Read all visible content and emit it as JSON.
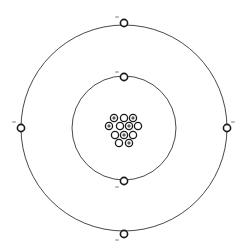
{
  "diagram": {
    "type": "bohr-atom-model",
    "center": [
      124,
      128
    ],
    "colors": {
      "line": "#333333",
      "particle": "#1a1a1a",
      "background": "#ffffff",
      "charge_sign": "#555555"
    },
    "shells": [
      {
        "name": "inner-shell",
        "radius": 52,
        "electrons": [
          {
            "angle": "top",
            "x": 124,
            "y": 77,
            "sign": "-",
            "sign_pos": [
              117,
              72
            ]
          },
          {
            "angle": "bottom",
            "x": 124,
            "y": 181,
            "sign": "-",
            "sign_pos": [
              117,
              187
            ]
          }
        ]
      },
      {
        "name": "outer-shell",
        "radius": 103,
        "electrons": [
          {
            "angle": "top",
            "x": 124,
            "y": 23,
            "sign": "-",
            "sign_pos": [
              117,
              17
            ]
          },
          {
            "angle": "bottom",
            "x": 124,
            "y": 234,
            "sign": "-",
            "sign_pos": [
              117,
              240
            ]
          },
          {
            "angle": "left",
            "x": 21,
            "y": 128,
            "sign": "-",
            "sign_pos": [
              14,
              122
            ]
          },
          {
            "angle": "right",
            "x": 227,
            "y": 128,
            "sign": "-",
            "sign_pos": [
              233,
              122
            ]
          }
        ]
      }
    ],
    "nucleus": {
      "particle_radius": 3.6,
      "protons": [
        [
          114,
          118
        ],
        [
          133,
          118
        ],
        [
          109,
          126
        ],
        [
          129,
          126
        ],
        [
          124,
          135
        ],
        [
          129,
          143
        ]
      ],
      "neutrons": [
        [
          124,
          118
        ],
        [
          120,
          126
        ],
        [
          138,
          126
        ],
        [
          115,
          135
        ],
        [
          133,
          135
        ],
        [
          119,
          143
        ]
      ],
      "proton_count": 6,
      "neutron_count": 6
    },
    "electron_radius": 3.6,
    "electron_count": 6
  }
}
